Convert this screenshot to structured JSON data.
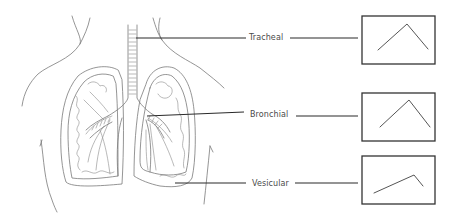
{
  "diagram": {
    "labels": [
      {
        "id": "tracheal",
        "text": "Tracheal",
        "x": 249,
        "y": 33
      },
      {
        "id": "bronchial",
        "text": "Bronchial",
        "x": 250,
        "y": 110
      },
      {
        "id": "vesicular",
        "text": "Vesicular",
        "x": 252,
        "y": 179
      }
    ],
    "boxes": [
      {
        "id": "tracheal-waveform",
        "x": 362,
        "y": 16,
        "w": 73,
        "h": 48,
        "waveform": [
          [
            378,
            50
          ],
          [
            407,
            24
          ],
          [
            428,
            49
          ]
        ]
      },
      {
        "id": "bronchial-waveform",
        "x": 362,
        "y": 93,
        "w": 73,
        "h": 48,
        "waveform": [
          [
            380,
            127
          ],
          [
            409,
            100
          ],
          [
            430,
            127
          ]
        ]
      },
      {
        "id": "vesicular-waveform",
        "x": 362,
        "y": 156,
        "w": 73,
        "h": 48,
        "waveform": [
          [
            374,
            193
          ],
          [
            414,
            175
          ],
          [
            423,
            186
          ]
        ]
      }
    ],
    "colors": {
      "text": "#4a4a4a",
      "leader": "#2a2a2a",
      "box": "#333333",
      "drawing": "#7a7a7a"
    }
  }
}
